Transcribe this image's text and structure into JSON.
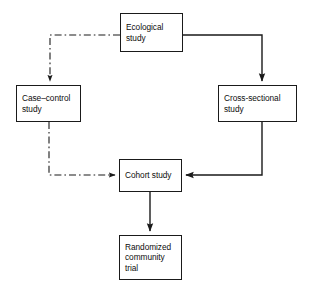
{
  "diagram": {
    "type": "flowchart",
    "background_color": "#ffffff",
    "line_color": "#1a1a1a",
    "text_color": "#0d0d0d",
    "nodes": [
      {
        "id": "ecological",
        "label": "Ecological study",
        "lines": [
          "Ecological",
          "study"
        ],
        "x": 120,
        "y": 13,
        "w": 63,
        "h": 39
      },
      {
        "id": "case_control",
        "label": "Case–control study",
        "lines": [
          "Case–control",
          "study"
        ],
        "x": 16,
        "y": 85,
        "w": 65,
        "h": 37
      },
      {
        "id": "cross_sectional",
        "label": "Cross-sectional study",
        "lines": [
          "Cross-sectional",
          "study"
        ],
        "x": 218,
        "y": 85,
        "w": 79,
        "h": 37
      },
      {
        "id": "cohort",
        "label": "Cohort study",
        "lines": [
          "Cohort study"
        ],
        "x": 119,
        "y": 159,
        "w": 63,
        "h": 33
      },
      {
        "id": "randomized",
        "label": "Randomized community trial",
        "lines": [
          "Randomized",
          "community",
          "trial"
        ],
        "x": 119,
        "y": 235,
        "w": 63,
        "h": 45
      }
    ],
    "edges": [
      {
        "id": "ecological-to-case-control",
        "from": "ecological",
        "to": "case_control",
        "style": "dash-dot",
        "path": "M 120 35 L 50 35 L 50 81",
        "arrowhead": "down"
      },
      {
        "id": "case-control-to-cohort",
        "from": "case_control",
        "to": "cohort",
        "style": "dash-dot",
        "path": "M 49 122 L 49 175 L 115 175",
        "arrowhead": "right"
      },
      {
        "id": "ecological-to-cross-sectional",
        "from": "ecological",
        "to": "cross_sectional",
        "style": "solid",
        "path": "M 183 35 L 262 35 L 262 81",
        "arrowhead": "down"
      },
      {
        "id": "cross-sectional-to-cohort",
        "from": "cross_sectional",
        "to": "cohort",
        "style": "solid",
        "path": "M 262 122 L 262 175 L 186 175",
        "arrowhead": "left"
      },
      {
        "id": "cohort-to-randomized",
        "from": "cohort",
        "to": "randomized",
        "style": "solid",
        "path": "M 150 192 L 150 231",
        "arrowhead": "down"
      }
    ]
  }
}
